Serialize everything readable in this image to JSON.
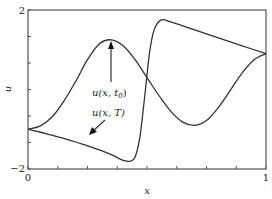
{
  "chart_data": {
    "type": "line",
    "title": "",
    "xlabel": "x",
    "ylabel": "u",
    "xlim": [
      0,
      1
    ],
    "ylim": [
      -2,
      2
    ],
    "xticks": [
      0,
      0.125,
      0.25,
      0.375,
      0.5,
      0.625,
      0.75,
      0.875,
      1
    ],
    "xtick_labels": [
      "0",
      "",
      "",
      "",
      "",
      "",
      "",
      "",
      "1"
    ],
    "yticks": [
      -2,
      -1.333,
      -0.667,
      0,
      0.667,
      1.333,
      2
    ],
    "ytick_labels": [
      "-2",
      "",
      "",
      "",
      "",
      "",
      "2"
    ],
    "grid": false,
    "legend": "none",
    "series": [
      {
        "name": "u(x, t0)",
        "x": [
          0,
          0.05,
          0.1,
          0.15,
          0.2,
          0.25,
          0.3,
          0.35,
          0.4,
          0.45,
          0.5,
          0.55,
          0.6,
          0.65,
          0.7,
          0.75,
          0.8,
          0.85,
          0.9,
          0.95,
          1
        ],
        "y": [
          -1.0,
          -0.92,
          -0.7,
          -0.3,
          0.2,
          0.75,
          1.15,
          1.25,
          1.1,
          0.75,
          0.3,
          -0.15,
          -0.55,
          -0.82,
          -0.9,
          -0.78,
          -0.45,
          -0.02,
          0.42,
          0.75,
          0.9
        ]
      },
      {
        "name": "u(x, T)",
        "x": [
          0,
          0.05,
          0.1,
          0.15,
          0.2,
          0.25,
          0.3,
          0.35,
          0.4,
          0.43,
          0.45,
          0.47,
          0.49,
          0.51,
          0.53,
          0.56,
          0.6,
          0.7,
          0.8,
          0.9,
          1
        ],
        "y": [
          -1.0,
          -1.07,
          -1.15,
          -1.23,
          -1.32,
          -1.42,
          -1.52,
          -1.64,
          -1.78,
          -1.8,
          -1.7,
          -1.2,
          -0.2,
          0.9,
          1.5,
          1.75,
          1.7,
          1.5,
          1.3,
          1.1,
          0.9
        ]
      }
    ],
    "annotations": [
      {
        "text": "u(x, t0)",
        "arrow_to": [
          0.35,
          1.25
        ],
        "text_at": [
          0.35,
          0.0
        ]
      },
      {
        "text": "u(x, T)",
        "arrow_to": [
          0.25,
          -1.42
        ],
        "text_at": [
          0.3,
          -0.6
        ]
      }
    ]
  },
  "labels": {
    "x_axis": "x",
    "y_axis": "u",
    "x_min": "0",
    "x_max": "1",
    "y_min": "−2",
    "y_max": "2",
    "annot_t0_prefix": "u(x, t",
    "annot_t0_sub": "0",
    "annot_t0_suffix": ")",
    "annot_T": "u(x, T)"
  }
}
